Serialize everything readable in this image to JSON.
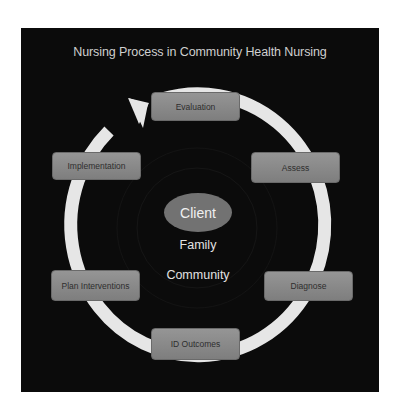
{
  "diagram": {
    "title": "Nursing Process in Community Health Nursing",
    "center": {
      "client": "Client",
      "family": "Family",
      "community": "Community"
    },
    "steps": [
      {
        "label": "Evaluation"
      },
      {
        "label": "Assess"
      },
      {
        "label": "Diagnose"
      },
      {
        "label": "ID Outcomes"
      },
      {
        "label": "Plan Interventions"
      },
      {
        "label": "Implementation"
      }
    ],
    "colors": {
      "background": "#0b0b0b",
      "ring": "#e6e6e6",
      "box_fill": "#8a8a8a",
      "client_fill": "#727272",
      "text_light": "#e2e2e2",
      "text_dark": "#2e2e2e"
    }
  }
}
